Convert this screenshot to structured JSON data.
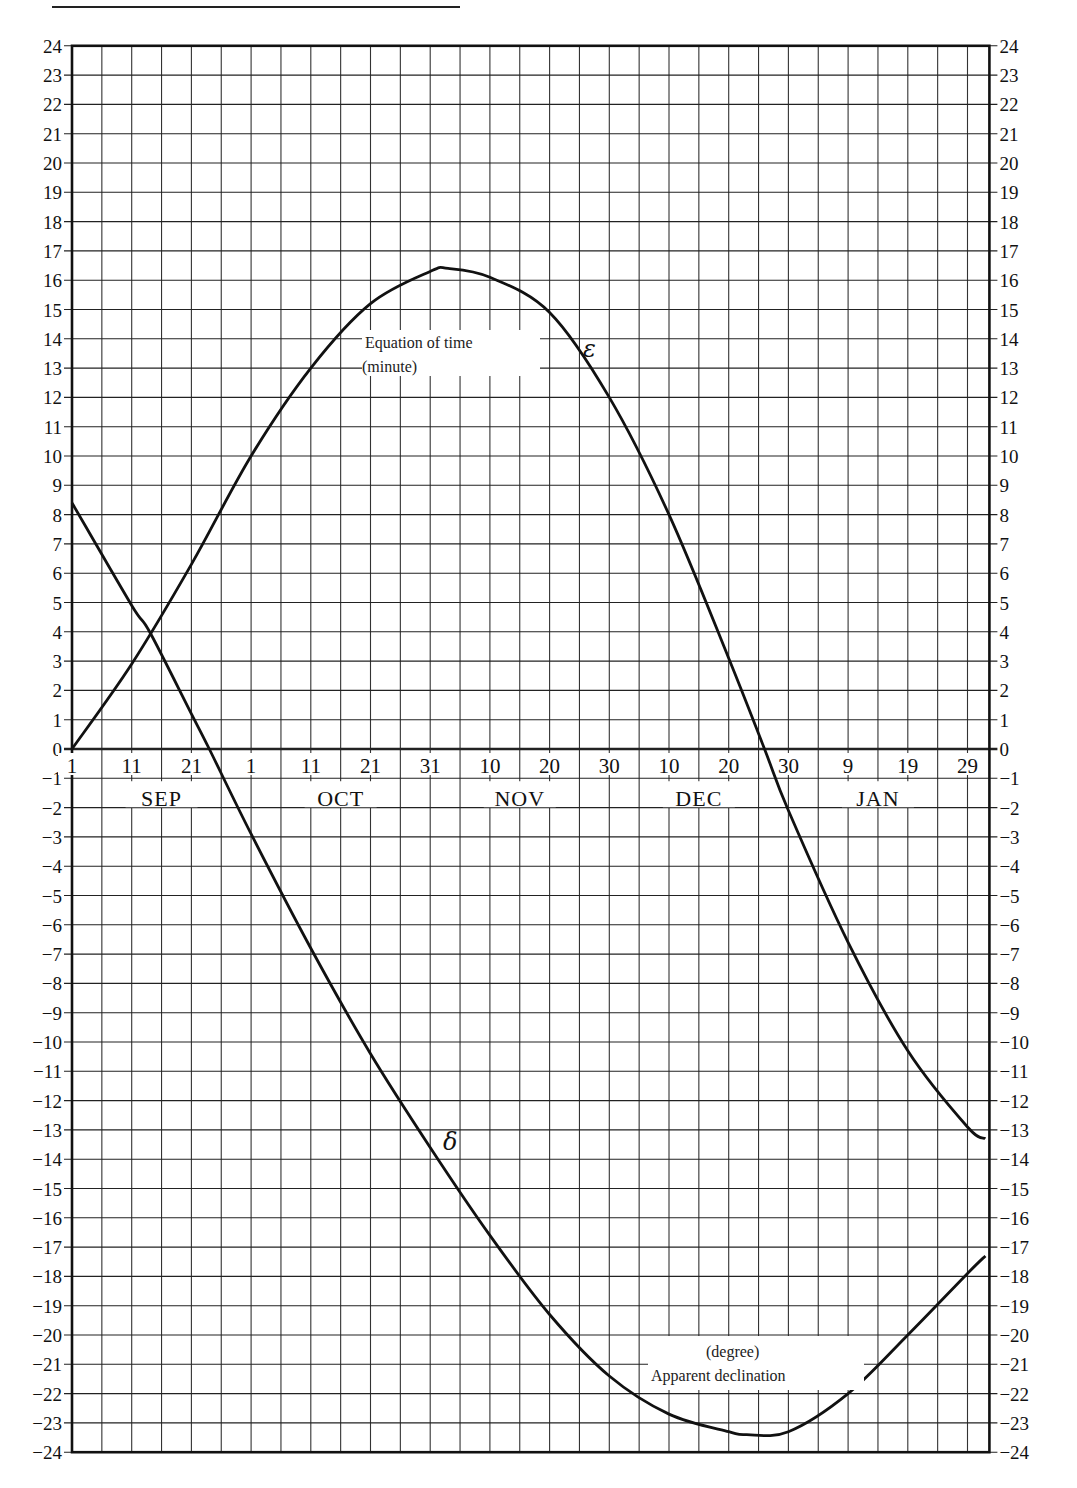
{
  "page": {
    "header_fragment": "Apparent declination"
  },
  "chart_data": {
    "type": "line",
    "title": "",
    "xlabel": "",
    "ylabel_left": "",
    "ylabel_right": "",
    "x_unit": "days since Sep 1",
    "ylim": [
      -24,
      24
    ],
    "xlim": [
      0,
      153
    ],
    "grid": true,
    "y_ticks": [
      -24,
      -23,
      -22,
      -21,
      -20,
      -19,
      -18,
      -17,
      -16,
      -15,
      -14,
      -13,
      -12,
      -11,
      -10,
      -9,
      -8,
      -7,
      -6,
      -5,
      -4,
      -3,
      -2,
      -1,
      0,
      1,
      2,
      3,
      4,
      5,
      6,
      7,
      8,
      9,
      10,
      11,
      12,
      13,
      14,
      15,
      16,
      17,
      18,
      19,
      20,
      21,
      22,
      23,
      24
    ],
    "x_tick_labels": [
      {
        "day": 0,
        "label": "1"
      },
      {
        "day": 10,
        "label": "11"
      },
      {
        "day": 20,
        "label": "21"
      },
      {
        "day": 30,
        "label": "1"
      },
      {
        "day": 40,
        "label": "11"
      },
      {
        "day": 50,
        "label": "21"
      },
      {
        "day": 60,
        "label": "31"
      },
      {
        "day": 70,
        "label": "10"
      },
      {
        "day": 80,
        "label": "20"
      },
      {
        "day": 90,
        "label": "30"
      },
      {
        "day": 100,
        "label": "10"
      },
      {
        "day": 110,
        "label": "20"
      },
      {
        "day": 120,
        "label": "30"
      },
      {
        "day": 130,
        "label": "9"
      },
      {
        "day": 140,
        "label": "19"
      },
      {
        "day": 150,
        "label": "29"
      }
    ],
    "months": [
      {
        "label": "SEP",
        "day": 15
      },
      {
        "label": "OCT",
        "day": 45
      },
      {
        "label": "NOV",
        "day": 75
      },
      {
        "label": "DEC",
        "day": 105
      },
      {
        "label": "JAN",
        "day": 135
      }
    ],
    "series": [
      {
        "name": "Equation of time (minute)",
        "symbol": "ε",
        "points": [
          [
            0,
            0
          ],
          [
            10,
            2.9
          ],
          [
            20,
            6.3
          ],
          [
            30,
            10.0
          ],
          [
            40,
            13.0
          ],
          [
            50,
            15.2
          ],
          [
            60,
            16.3
          ],
          [
            63,
            16.4
          ],
          [
            70,
            16.1
          ],
          [
            80,
            14.9
          ],
          [
            90,
            12.0
          ],
          [
            100,
            8.0
          ],
          [
            110,
            3.1
          ],
          [
            116,
            0
          ],
          [
            120,
            -2.1
          ],
          [
            130,
            -6.6
          ],
          [
            140,
            -10.3
          ],
          [
            150,
            -12.9
          ],
          [
            153,
            -13.3
          ]
        ]
      },
      {
        "name": "Apparent declination (degree)",
        "symbol": "δ",
        "points": [
          [
            0,
            8.4
          ],
          [
            10,
            4.9
          ],
          [
            13,
            4.0
          ],
          [
            20,
            1.2
          ],
          [
            23,
            0
          ],
          [
            30,
            -2.9
          ],
          [
            40,
            -6.8
          ],
          [
            50,
            -10.4
          ],
          [
            60,
            -13.6
          ],
          [
            70,
            -16.6
          ],
          [
            80,
            -19.3
          ],
          [
            90,
            -21.4
          ],
          [
            100,
            -22.7
          ],
          [
            110,
            -23.3
          ],
          [
            113,
            -23.4
          ],
          [
            120,
            -23.3
          ],
          [
            130,
            -22.0
          ],
          [
            140,
            -20.0
          ],
          [
            150,
            -17.9
          ],
          [
            153,
            -17.3
          ]
        ]
      }
    ],
    "annotations": {
      "eot_label_line1": "Equation of time",
      "eot_label_line2": "(minute)",
      "eot_symbol": "ε",
      "dec_label_line1": "(degree)",
      "dec_label_line2": "Apparent declination",
      "dec_symbol": "δ"
    }
  }
}
